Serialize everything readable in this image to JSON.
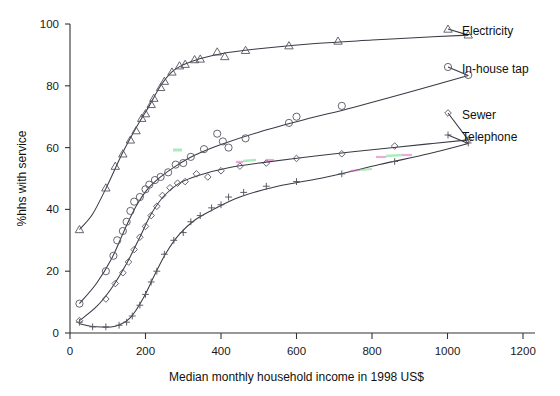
{
  "chart_data": {
    "type": "scatter",
    "title": "",
    "xlabel": "Median monthly household income in 1998 US$",
    "ylabel": "%hhs with service",
    "xlim": [
      0,
      1200
    ],
    "ylim": [
      0,
      100
    ],
    "xticks": [
      0,
      200,
      400,
      600,
      800,
      1000,
      1200
    ],
    "yticks": [
      0,
      20,
      40,
      60,
      80,
      100
    ],
    "grid": false,
    "legend_position": "right-inline-at-curve-end",
    "series": [
      {
        "name": "Electricity",
        "marker": "triangle",
        "color": "#444444",
        "label_x": 1215,
        "label_y": 96,
        "points": [
          {
            "x": 25,
            "y": 33.5
          },
          {
            "x": 95,
            "y": 47.0
          },
          {
            "x": 120,
            "y": 54.0
          },
          {
            "x": 140,
            "y": 58.0
          },
          {
            "x": 160,
            "y": 62.5
          },
          {
            "x": 175,
            "y": 65.5
          },
          {
            "x": 190,
            "y": 69.5
          },
          {
            "x": 200,
            "y": 71.0
          },
          {
            "x": 215,
            "y": 74.0
          },
          {
            "x": 222,
            "y": 76.0
          },
          {
            "x": 240,
            "y": 79.5
          },
          {
            "x": 250,
            "y": 81.5
          },
          {
            "x": 270,
            "y": 84.5
          },
          {
            "x": 290,
            "y": 86.5
          },
          {
            "x": 305,
            "y": 87.0
          },
          {
            "x": 330,
            "y": 88.5
          },
          {
            "x": 345,
            "y": 88.7
          },
          {
            "x": 390,
            "y": 91.0
          },
          {
            "x": 410,
            "y": 89.5
          },
          {
            "x": 465,
            "y": 91.5
          },
          {
            "x": 580,
            "y": 93.0
          },
          {
            "x": 710,
            "y": 94.5
          },
          {
            "x": 1055,
            "y": 96.5
          }
        ],
        "fit": [
          {
            "x": 25,
            "y": 33.5
          },
          {
            "x": 60,
            "y": 38.5
          },
          {
            "x": 100,
            "y": 48.0
          },
          {
            "x": 140,
            "y": 58.5
          },
          {
            "x": 180,
            "y": 67.5
          },
          {
            "x": 210,
            "y": 73.5
          },
          {
            "x": 240,
            "y": 80.0
          },
          {
            "x": 270,
            "y": 84.5
          },
          {
            "x": 300,
            "y": 86.8
          },
          {
            "x": 340,
            "y": 88.6
          },
          {
            "x": 400,
            "y": 90.4
          },
          {
            "x": 500,
            "y": 92.0
          },
          {
            "x": 650,
            "y": 93.7
          },
          {
            "x": 800,
            "y": 94.8
          },
          {
            "x": 950,
            "y": 95.8
          },
          {
            "x": 1055,
            "y": 96.4
          }
        ]
      },
      {
        "name": "In-house tap",
        "marker": "circle",
        "color": "#444444",
        "label_x": 1215,
        "label_y": 84,
        "points": [
          {
            "x": 25,
            "y": 9.5
          },
          {
            "x": 95,
            "y": 20.0
          },
          {
            "x": 115,
            "y": 25.0
          },
          {
            "x": 125,
            "y": 30.0
          },
          {
            "x": 140,
            "y": 33.0
          },
          {
            "x": 150,
            "y": 36.0
          },
          {
            "x": 160,
            "y": 39.5
          },
          {
            "x": 170,
            "y": 42.5
          },
          {
            "x": 185,
            "y": 44.0
          },
          {
            "x": 200,
            "y": 46.5
          },
          {
            "x": 210,
            "y": 48.0
          },
          {
            "x": 225,
            "y": 49.5
          },
          {
            "x": 240,
            "y": 50.5
          },
          {
            "x": 260,
            "y": 52.0
          },
          {
            "x": 280,
            "y": 54.5
          },
          {
            "x": 300,
            "y": 55.0
          },
          {
            "x": 320,
            "y": 57.0
          },
          {
            "x": 355,
            "y": 59.5
          },
          {
            "x": 390,
            "y": 64.5
          },
          {
            "x": 405,
            "y": 62.0
          },
          {
            "x": 420,
            "y": 60.0
          },
          {
            "x": 465,
            "y": 63.0
          },
          {
            "x": 580,
            "y": 68.0
          },
          {
            "x": 600,
            "y": 70.0
          },
          {
            "x": 720,
            "y": 73.5
          },
          {
            "x": 1055,
            "y": 83.5
          }
        ],
        "fit": [
          {
            "x": 25,
            "y": 9.5
          },
          {
            "x": 70,
            "y": 16.0
          },
          {
            "x": 110,
            "y": 24.0
          },
          {
            "x": 145,
            "y": 33.5
          },
          {
            "x": 175,
            "y": 41.0
          },
          {
            "x": 205,
            "y": 46.5
          },
          {
            "x": 240,
            "y": 50.5
          },
          {
            "x": 280,
            "y": 54.0
          },
          {
            "x": 330,
            "y": 57.5
          },
          {
            "x": 400,
            "y": 61.0
          },
          {
            "x": 500,
            "y": 65.0
          },
          {
            "x": 620,
            "y": 69.0
          },
          {
            "x": 750,
            "y": 73.0
          },
          {
            "x": 900,
            "y": 78.0
          },
          {
            "x": 1055,
            "y": 83.3
          }
        ]
      },
      {
        "name": "Sewer",
        "marker": "diamond",
        "color": "#444444",
        "label_x": 1215,
        "label_y": 67,
        "points": [
          {
            "x": 25,
            "y": 4.0
          },
          {
            "x": 95,
            "y": 11.0
          },
          {
            "x": 120,
            "y": 16.0
          },
          {
            "x": 140,
            "y": 19.5
          },
          {
            "x": 155,
            "y": 23.0
          },
          {
            "x": 170,
            "y": 27.0
          },
          {
            "x": 185,
            "y": 31.0
          },
          {
            "x": 200,
            "y": 34.5
          },
          {
            "x": 215,
            "y": 38.0
          },
          {
            "x": 230,
            "y": 41.0
          },
          {
            "x": 245,
            "y": 44.5
          },
          {
            "x": 265,
            "y": 47.0
          },
          {
            "x": 285,
            "y": 48.5
          },
          {
            "x": 305,
            "y": 49.0
          },
          {
            "x": 335,
            "y": 51.5
          },
          {
            "x": 365,
            "y": 50.5
          },
          {
            "x": 400,
            "y": 52.5
          },
          {
            "x": 450,
            "y": 54.0
          },
          {
            "x": 520,
            "y": 55.0
          },
          {
            "x": 600,
            "y": 56.5
          },
          {
            "x": 720,
            "y": 58.0
          },
          {
            "x": 860,
            "y": 60.5
          },
          {
            "x": 1055,
            "y": 62.5
          }
        ],
        "fit": [
          {
            "x": 25,
            "y": 4.0
          },
          {
            "x": 70,
            "y": 8.5
          },
          {
            "x": 110,
            "y": 14.5
          },
          {
            "x": 150,
            "y": 22.5
          },
          {
            "x": 185,
            "y": 31.0
          },
          {
            "x": 215,
            "y": 38.5
          },
          {
            "x": 250,
            "y": 44.5
          },
          {
            "x": 290,
            "y": 48.5
          },
          {
            "x": 340,
            "y": 51.0
          },
          {
            "x": 420,
            "y": 53.5
          },
          {
            "x": 520,
            "y": 55.3
          },
          {
            "x": 650,
            "y": 57.3
          },
          {
            "x": 800,
            "y": 59.3
          },
          {
            "x": 950,
            "y": 61.2
          },
          {
            "x": 1055,
            "y": 62.5
          }
        ]
      },
      {
        "name": "Telephone",
        "marker": "plus",
        "color": "#444444",
        "label_x": 1215,
        "label_y": 56,
        "points": [
          {
            "x": 25,
            "y": 3.5
          },
          {
            "x": 60,
            "y": 2.0
          },
          {
            "x": 95,
            "y": 2.0
          },
          {
            "x": 130,
            "y": 2.5
          },
          {
            "x": 150,
            "y": 3.5
          },
          {
            "x": 165,
            "y": 5.5
          },
          {
            "x": 185,
            "y": 9.0
          },
          {
            "x": 200,
            "y": 12.5
          },
          {
            "x": 215,
            "y": 16.5
          },
          {
            "x": 230,
            "y": 20.0
          },
          {
            "x": 250,
            "y": 25.5
          },
          {
            "x": 275,
            "y": 30.0
          },
          {
            "x": 300,
            "y": 32.5
          },
          {
            "x": 320,
            "y": 36.0
          },
          {
            "x": 345,
            "y": 38.0
          },
          {
            "x": 375,
            "y": 40.5
          },
          {
            "x": 400,
            "y": 41.5
          },
          {
            "x": 420,
            "y": 44.0
          },
          {
            "x": 460,
            "y": 45.5
          },
          {
            "x": 520,
            "y": 47.5
          },
          {
            "x": 600,
            "y": 49.0
          },
          {
            "x": 720,
            "y": 51.5
          },
          {
            "x": 860,
            "y": 55.5
          },
          {
            "x": 1055,
            "y": 61.5
          }
        ],
        "fit": [
          {
            "x": 25,
            "y": 3.0
          },
          {
            "x": 70,
            "y": 2.0
          },
          {
            "x": 120,
            "y": 2.2
          },
          {
            "x": 160,
            "y": 5.0
          },
          {
            "x": 195,
            "y": 11.5
          },
          {
            "x": 225,
            "y": 19.0
          },
          {
            "x": 255,
            "y": 26.0
          },
          {
            "x": 290,
            "y": 32.0
          },
          {
            "x": 330,
            "y": 36.5
          },
          {
            "x": 380,
            "y": 40.0
          },
          {
            "x": 450,
            "y": 44.0
          },
          {
            "x": 550,
            "y": 47.5
          },
          {
            "x": 680,
            "y": 50.5
          },
          {
            "x": 820,
            "y": 54.5
          },
          {
            "x": 950,
            "y": 58.0
          },
          {
            "x": 1055,
            "y": 61.3
          }
        ]
      }
    ]
  },
  "axes": {
    "x_title": "Median monthly household income in 1998 US$",
    "y_title": "%hhs with service",
    "x_tick_labels": [
      "0",
      "200",
      "400",
      "600",
      "800",
      "1000",
      "1200"
    ],
    "y_tick_labels": [
      "0",
      "20",
      "40",
      "60",
      "80",
      "100"
    ]
  },
  "series_labels": {
    "electricity": "Electricity",
    "in_house_tap": "In-house tap",
    "sewer": "Sewer",
    "telephone": "Telephone"
  },
  "colors": {
    "ink": "#333333",
    "axis": "#333333",
    "background": "#ffffff",
    "artifact_green": "#66dd88",
    "artifact_magenta": "#dd66bb"
  }
}
